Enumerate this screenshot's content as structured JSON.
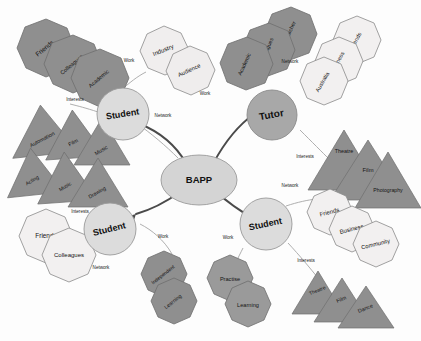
{
  "diagram": {
    "title": "BAPP",
    "center": {
      "label": "BAPP"
    },
    "nodes": [
      {
        "id": "student-top",
        "label": "Student"
      },
      {
        "id": "tutor",
        "label": "Tutor"
      },
      {
        "id": "student-right",
        "label": "Student"
      },
      {
        "id": "student-left",
        "label": "Student"
      }
    ],
    "edges": [
      {
        "from": "student-top",
        "label": "Work"
      },
      {
        "from": "student-top",
        "label": "Interests"
      },
      {
        "from": "student-top",
        "label": "Network"
      },
      {
        "from": "tutor",
        "label": "Work"
      },
      {
        "from": "tutor",
        "label": "Network"
      },
      {
        "from": "tutor",
        "label": "Interests"
      },
      {
        "from": "student-right",
        "label": "Network"
      },
      {
        "from": "student-right",
        "label": "Interests"
      },
      {
        "from": "student-right",
        "label": "Work"
      },
      {
        "from": "student-left",
        "label": "Work"
      },
      {
        "from": "student-left",
        "label": "Interests"
      },
      {
        "from": "student-left",
        "label": "Network"
      }
    ],
    "clusters": [
      {
        "id": "network-top-left",
        "shape": "octagon",
        "tone": "dark",
        "items": [
          "Friends",
          "Colleagues",
          "Academic"
        ]
      },
      {
        "id": "work-top-mid",
        "shape": "octagon",
        "tone": "light",
        "items": [
          "Industry",
          "Audience"
        ]
      },
      {
        "id": "network-tutor",
        "shape": "octagon",
        "tone": "dark",
        "items": [
          "Researcher",
          "Colleagues",
          "Academic"
        ]
      },
      {
        "id": "network-top-right",
        "shape": "octagon",
        "tone": "light",
        "items": [
          "Friends",
          "Business",
          "Australia"
        ]
      },
      {
        "id": "interests-left-a",
        "shape": "triangle",
        "tone": "dark",
        "items": [
          "Automation",
          "Film",
          "Music"
        ]
      },
      {
        "id": "interests-left-b",
        "shape": "triangle",
        "tone": "dark",
        "items": [
          "Acting",
          "Music",
          "Drawing"
        ]
      },
      {
        "id": "interests-tutor",
        "shape": "triangle",
        "tone": "dark",
        "items": [
          "Theatre",
          "Film",
          "Photography"
        ]
      },
      {
        "id": "network-right",
        "shape": "octagon",
        "tone": "light",
        "items": [
          "Friends",
          "Business",
          "Community"
        ]
      },
      {
        "id": "interests-right",
        "shape": "triangle",
        "tone": "dark",
        "items": [
          "Theatre",
          "Film",
          "Dance"
        ]
      },
      {
        "id": "network-bot-left",
        "shape": "octagon",
        "tone": "light",
        "items": [
          "Friends",
          "Colleagues"
        ]
      },
      {
        "id": "work-bot-left",
        "shape": "octagon",
        "tone": "dark",
        "items": [
          "Independent",
          "Learning"
        ]
      },
      {
        "id": "work-bot-right",
        "shape": "octagon",
        "tone": "dark",
        "items": [
          "Practise",
          "Learning"
        ]
      }
    ],
    "colors": {
      "dark_fill": "#8f8f8f",
      "light_fill": "#eceaea",
      "stroke": "#6e6e6e",
      "edge": "#9a9a9a",
      "node_fill": "#d9d9d9",
      "center_fill": "#d4d4d4",
      "text": "#141414"
    }
  }
}
